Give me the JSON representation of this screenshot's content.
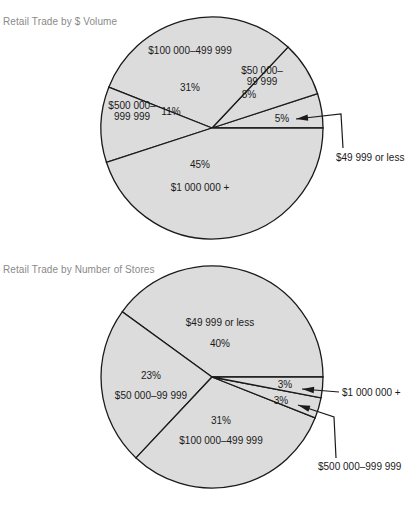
{
  "chart_data": [
    {
      "type": "pie",
      "title": "Retail Trade by $ Volume",
      "start_direction": "right (3 o'clock), proceeding counter-clockwise",
      "slices": [
        {
          "label": "$49 999 or less",
          "label_lines": [
            "$49 999 or less"
          ],
          "value": 5,
          "pct_text": "5%",
          "label_placement": "outside-callout"
        },
        {
          "label": "$50 000–99 999",
          "label_lines": [
            "$50 000–",
            "99 999"
          ],
          "value": 8,
          "pct_text": "8%",
          "label_placement": "inside"
        },
        {
          "label": "$100 000–499 999",
          "label_lines": [
            "$100 000–499 999"
          ],
          "value": 31,
          "pct_text": "31%",
          "label_placement": "inside"
        },
        {
          "label": "$500 000–999 999",
          "label_lines": [
            "$500 000–",
            "999 999"
          ],
          "value": 11,
          "pct_text": "11%",
          "label_placement": "inside"
        },
        {
          "label": "$1 000 000 +",
          "label_lines": [
            "$1 000 000 +"
          ],
          "value": 45,
          "pct_text": "45%",
          "label_placement": "inside"
        }
      ]
    },
    {
      "type": "pie",
      "title": "Retail Trade by Number of Stores",
      "start_direction": "right (3 o'clock), proceeding counter-clockwise",
      "slices": [
        {
          "label": "$49 999 or less",
          "label_lines": [
            "$49 999 or less"
          ],
          "value": 40,
          "pct_text": "40%",
          "label_placement": "inside"
        },
        {
          "label": "$50 000–99 999",
          "label_lines": [
            "$50 000–99 999"
          ],
          "value": 23,
          "pct_text": "23%",
          "label_placement": "inside"
        },
        {
          "label": "$100 000–499 999",
          "label_lines": [
            "$100 000–499 999"
          ],
          "value": 31,
          "pct_text": "31%",
          "label_placement": "inside"
        },
        {
          "label": "$500 000–999 999",
          "label_lines": [
            "$500 000–999 999"
          ],
          "value": 3,
          "pct_text": "3%",
          "label_placement": "outside-callout"
        },
        {
          "label": "$1 000 000 +",
          "label_lines": [
            "$1 000 000 +"
          ],
          "value": 3,
          "pct_text": "3%",
          "label_placement": "outside-callout"
        }
      ]
    }
  ],
  "colors": {
    "slice_fill": "#dcdcdc",
    "outline": "#1a1a1a",
    "title_text": "#8a8a8a"
  }
}
